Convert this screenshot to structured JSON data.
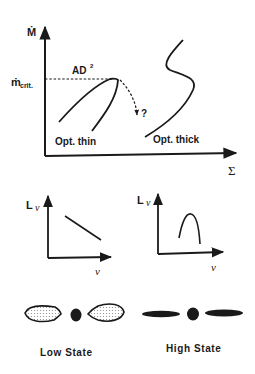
{
  "top_plot": {
    "y_axis_label": "Ṁ",
    "x_axis_label": "Σ",
    "critical_label_main": "ṁ",
    "critical_label_sub": "crit.",
    "ad_label": "AD",
    "ad_superscript": "2",
    "question_mark": "?",
    "thin_branch_label": "Opt. thin",
    "thick_branch_label": "Opt. thick"
  },
  "spectrum_plots": [
    {
      "y_axis_label": "L",
      "y_axis_sub": "ν",
      "x_axis_label": "ν",
      "shape": "declining line"
    },
    {
      "y_axis_label": "L",
      "y_axis_sub": "ν",
      "x_axis_label": "ν",
      "shape": "peaked bump"
    }
  ],
  "states": [
    {
      "label": "Low State",
      "disk": "thick dotted lens-shaped disk"
    },
    {
      "label": "High State",
      "disk": "thin solid disk"
    }
  ],
  "colors": {
    "ink": "#1a1a1a",
    "background": "#ffffff",
    "stipple": "#b8b8b8"
  }
}
